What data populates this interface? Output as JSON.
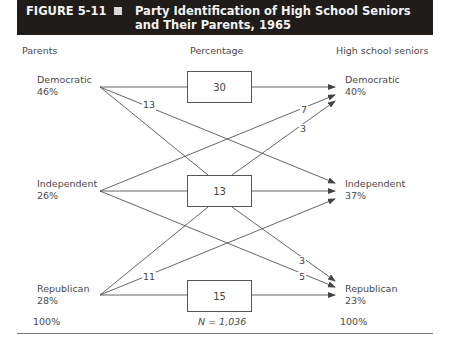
{
  "figure": {
    "number": "FIGURE 5-11",
    "title": "Party Identification of High School Seniors and Their Parents, 1965"
  },
  "headers": {
    "left": "Parents",
    "middle": "Percentage",
    "right": "High school seniors"
  },
  "parents": [
    {
      "party": "Democratic",
      "pct": "46%"
    },
    {
      "party": "Independent",
      "pct": "26%"
    },
    {
      "party": "Republican",
      "pct": "28%"
    }
  ],
  "seniors": [
    {
      "party": "Democratic",
      "pct": "40%"
    },
    {
      "party": "Independent",
      "pct": "37%"
    },
    {
      "party": "Republican",
      "pct": "23%"
    }
  ],
  "boxes": [
    {
      "value": "30",
      "meaning": "Democratic parents → Democratic seniors"
    },
    {
      "value": "13",
      "meaning": "Independent parents → Independent seniors"
    },
    {
      "value": "15",
      "meaning": "Republican parents → Republican seniors"
    }
  ],
  "flows": [
    {
      "from": "Democratic",
      "to": "Independent",
      "value": "13"
    },
    {
      "from": "Independent",
      "to": "Democratic",
      "value": "7"
    },
    {
      "from": "Republican",
      "to": "Democratic",
      "value": "3"
    },
    {
      "from": "Democratic",
      "to": "Republican",
      "value": "3"
    },
    {
      "from": "Independent",
      "to": "Republican",
      "value": "5"
    },
    {
      "from": "Republican",
      "to": "Independent",
      "value": "11"
    }
  ],
  "totals": {
    "parents": "100%",
    "n": "N = 1,036",
    "seniors": "100%"
  },
  "colors": {
    "title_bg": "#1f1c1a",
    "title_text": "#f2f2f2",
    "line": "#555555"
  }
}
